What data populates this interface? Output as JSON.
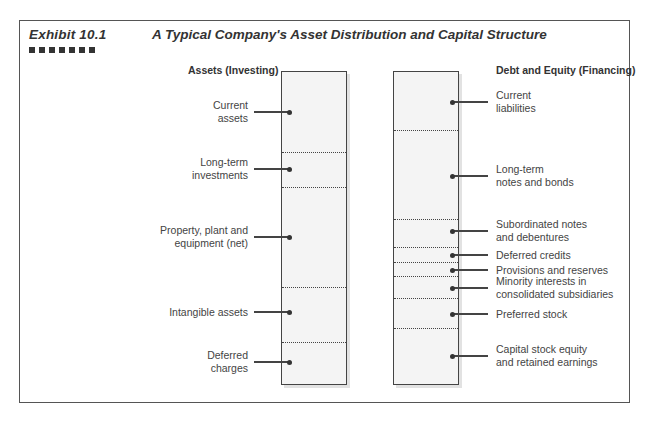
{
  "header": {
    "exhibit": "Exhibit 10.1",
    "title": "A Typical Company's Asset Distribution and Capital Structure",
    "squares": 7
  },
  "assets": {
    "heading": "Assets (Investing)",
    "items": [
      {
        "label": "Current\nassets",
        "y": 112
      },
      {
        "label": "Long-term\ninvestments",
        "y": 169
      },
      {
        "label": "Property, plant and\nequipment (net)",
        "y": 237
      },
      {
        "label": "Intangible assets",
        "y": 312
      },
      {
        "label": "Deferred\ncharges",
        "y": 362
      }
    ],
    "dividers": [
      152,
      187,
      287,
      342
    ]
  },
  "financing": {
    "heading": "Debt and Equity (Financing)",
    "items": [
      {
        "label": "Current\nliabilities",
        "y": 102
      },
      {
        "label": "Long-term\nnotes and bonds",
        "y": 176
      },
      {
        "label": "Subordinated notes\nand debentures",
        "y": 231
      },
      {
        "label": "Deferred credits",
        "y": 255
      },
      {
        "label": "Provisions and reserves",
        "y": 270
      },
      {
        "label": "Minority interests in\nconsolidated subsidiaries",
        "y": 288
      },
      {
        "label": "Preferred stock",
        "y": 314
      },
      {
        "label": "Capital stock equity\nand retained earnings",
        "y": 356
      }
    ],
    "dividers": [
      130,
      219,
      247,
      262,
      276,
      298,
      328
    ]
  }
}
